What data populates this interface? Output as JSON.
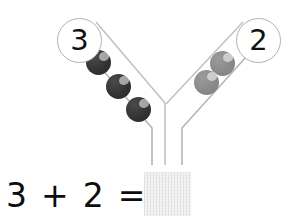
{
  "worksheet": {
    "type": "number-bond-addition-worksheet",
    "background_color": "#ffffff"
  },
  "diagram": {
    "name": "y-shaped-number-bond-chute",
    "stroke_color": "#b5b5b5",
    "left_branch": {
      "bubble_label": "3",
      "counter_count": 3,
      "counter_color": "#333333"
    },
    "right_branch": {
      "bubble_label": "2",
      "counter_count": 2,
      "counter_color": "#8a8a8a"
    }
  },
  "counters": {
    "left": [
      {
        "label": "counter-left-1",
        "x": 86,
        "y": 50
      },
      {
        "label": "counter-left-2",
        "x": 106,
        "y": 74
      },
      {
        "label": "counter-left-3",
        "x": 126,
        "y": 97
      }
    ],
    "right": [
      {
        "label": "counter-right-1",
        "x": 210,
        "y": 51
      },
      {
        "label": "counter-right-2",
        "x": 194,
        "y": 70
      }
    ]
  },
  "equation": {
    "first_addend": "3",
    "plus_sign": "+",
    "second_addend": "2",
    "equals_sign": "=",
    "answer_value": "",
    "answer_box_placeholder": ""
  },
  "colors": {
    "dark_counter": "#333333",
    "light_counter": "#8a8a8a",
    "chute_line": "#b5b5b5",
    "answer_box_fill": "#f4f4f4",
    "text": "#0d0d0d"
  }
}
